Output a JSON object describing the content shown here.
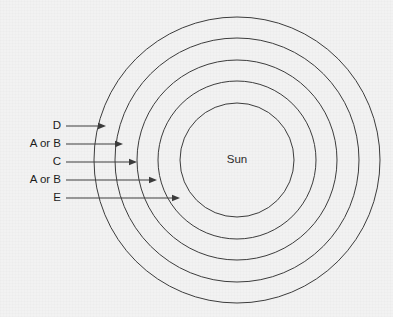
{
  "diagram": {
    "center_label": "Sun",
    "background_color": "#f2f2f2",
    "stroke_color": "#3c3c3c",
    "text_color": "#1c1c1c",
    "center": {
      "x": 237,
      "y": 160
    },
    "rings": [
      {
        "id": "ring-5-outermost",
        "radius": 143
      },
      {
        "id": "ring-4",
        "radius": 122
      },
      {
        "id": "ring-3",
        "radius": 100
      },
      {
        "id": "ring-2",
        "radius": 79
      },
      {
        "id": "ring-1-innermost",
        "radius": 57
      }
    ],
    "callouts": [
      {
        "id": "callout-d",
        "label": "D",
        "label_x": 61,
        "y": 126,
        "line_start_x": 66,
        "line_end_x": 106
      },
      {
        "id": "callout-a-or-b-outer",
        "label": "A or B",
        "label_x": 61,
        "y": 144,
        "line_start_x": 66,
        "line_end_x": 123
      },
      {
        "id": "callout-c",
        "label": "C",
        "label_x": 61,
        "y": 162,
        "line_start_x": 66,
        "line_end_x": 137
      },
      {
        "id": "callout-a-or-b-inner",
        "label": "A or B",
        "label_x": 61,
        "y": 180,
        "line_start_x": 66,
        "line_end_x": 157
      },
      {
        "id": "callout-e",
        "label": "E",
        "label_x": 61,
        "y": 198,
        "line_start_x": 66,
        "line_end_x": 180
      }
    ]
  }
}
